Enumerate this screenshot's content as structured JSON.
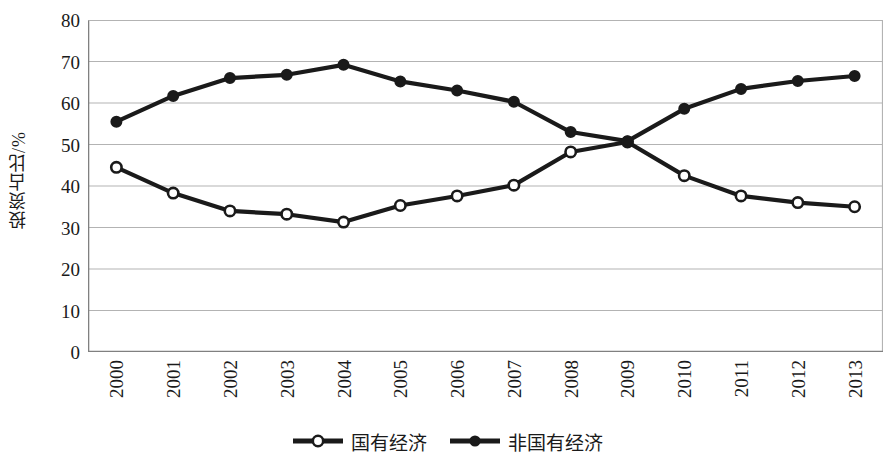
{
  "chart_data": {
    "type": "line",
    "title": "",
    "xlabel": "",
    "ylabel": "投资占比/%",
    "ylim": [
      0,
      80
    ],
    "ytick_step": 10,
    "yticks": [
      "0",
      "10",
      "20",
      "30",
      "40",
      "50",
      "60",
      "70",
      "80"
    ],
    "grid": true,
    "legend_position": "bottom",
    "categories": [
      "2000",
      "2001",
      "2002",
      "2003",
      "2004",
      "2005",
      "2006",
      "2007",
      "2008",
      "2009",
      "2010",
      "2011",
      "2012",
      "2013"
    ],
    "series": [
      {
        "name": "国有经济",
        "marker": "open-circle",
        "color": "#1a1a1a",
        "values": [
          44.5,
          38.3,
          34.0,
          33.2,
          31.3,
          35.3,
          37.6,
          40.2,
          48.2,
          50.6,
          42.5,
          37.6,
          36.0,
          35.0
        ]
      },
      {
        "name": "非国有经济",
        "marker": "filled-circle",
        "color": "#1a1a1a",
        "values": [
          55.5,
          61.7,
          66.0,
          66.8,
          69.2,
          65.2,
          63.0,
          60.3,
          53.0,
          50.8,
          58.6,
          63.4,
          65.3,
          66.5
        ]
      }
    ]
  },
  "colors": {
    "line": "#1a1a1a",
    "grid": "#b3b3b3",
    "axis": "#808080",
    "background": "#ffffff",
    "marker_fill_open": "#ffffff"
  },
  "legend": {
    "entries": [
      {
        "label": "国有经济",
        "marker": "open-circle"
      },
      {
        "label": "非国有经济",
        "marker": "filled-circle"
      }
    ]
  }
}
